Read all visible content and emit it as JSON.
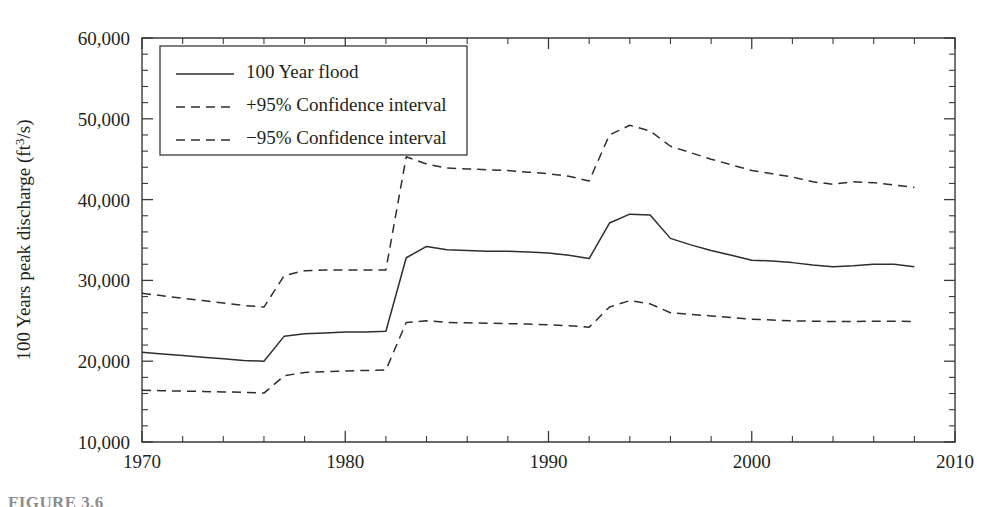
{
  "chart_data": {
    "type": "line",
    "title": "",
    "xlabel": "",
    "ylabel": "100 Years peak discharge (ft3/s)",
    "ylabel_prefix": "100 Years peak discharge (ft",
    "ylabel_sup": "3",
    "ylabel_suffix": "/s)",
    "xlim": [
      1970,
      2010
    ],
    "ylim": [
      10000,
      60000
    ],
    "x_major_ticks": [
      1970,
      1980,
      1990,
      2000,
      2010
    ],
    "x_major_tick_labels": [
      "1970",
      "1980",
      "1990",
      "2000",
      "2010"
    ],
    "x_minor_tick_step": 2,
    "y_major_ticks": [
      10000,
      20000,
      30000,
      40000,
      50000,
      60000
    ],
    "y_major_tick_labels": [
      "10,000",
      "20,000",
      "30,000",
      "40,000",
      "50,000",
      "60,000"
    ],
    "y_minor_tick_step": 2000,
    "grid": false,
    "legend_position": "top-left-inside",
    "x": [
      1970,
      1971,
      1972,
      1973,
      1974,
      1975,
      1976,
      1977,
      1978,
      1979,
      1980,
      1981,
      1982,
      1983,
      1984,
      1985,
      1986,
      1987,
      1988,
      1989,
      1990,
      1991,
      1992,
      1993,
      1994,
      1995,
      1996,
      1997,
      1998,
      1999,
      2000,
      2001,
      2002,
      2003,
      2004,
      2005,
      2006,
      2007,
      2008
    ],
    "series": [
      {
        "name": "100 Year flood",
        "style": "solid",
        "color": "#2e2e2e",
        "values": [
          21100,
          20900,
          20700,
          20500,
          20300,
          20100,
          20000,
          23100,
          23400,
          23500,
          23600,
          23600,
          23700,
          32800,
          34200,
          33800,
          33700,
          33600,
          33600,
          33500,
          33400,
          33100,
          32700,
          37100,
          38200,
          38100,
          35200,
          34400,
          33700,
          33100,
          32500,
          32400,
          32200,
          31900,
          31700,
          31800,
          32000,
          32000,
          31700
        ]
      },
      {
        "name": "+95% Confidence interval",
        "style": "dashed",
        "color": "#2e2e2e",
        "values": [
          28400,
          28100,
          27800,
          27500,
          27200,
          26900,
          26700,
          30600,
          31200,
          31300,
          31300,
          31300,
          31300,
          45300,
          44400,
          43900,
          43800,
          43700,
          43600,
          43400,
          43200,
          42900,
          42300,
          48000,
          49200,
          48500,
          46600,
          45800,
          45000,
          44300,
          43600,
          43200,
          42800,
          42200,
          41900,
          42200,
          42100,
          41800,
          41500
        ]
      },
      {
        "name": "-95% Confidence interval",
        "style": "dashed",
        "color": "#2e2e2e",
        "values": [
          16400,
          16350,
          16300,
          16250,
          16200,
          16150,
          16050,
          18200,
          18600,
          18700,
          18800,
          18850,
          18900,
          24800,
          25000,
          24800,
          24750,
          24700,
          24650,
          24600,
          24500,
          24400,
          24200,
          26700,
          27500,
          27100,
          26000,
          25800,
          25600,
          25400,
          25200,
          25100,
          25000,
          24950,
          24900,
          24900,
          24950,
          24950,
          24900
        ]
      }
    ]
  },
  "legend": {
    "items": [
      {
        "label": "100 Year flood",
        "style": "solid"
      },
      {
        "label": "+95% Confidence interval",
        "style": "dashed"
      },
      {
        "label": "−95% Confidence interval",
        "style": "dashed"
      }
    ]
  },
  "caption": {
    "text": "FIGURE 3.6"
  }
}
